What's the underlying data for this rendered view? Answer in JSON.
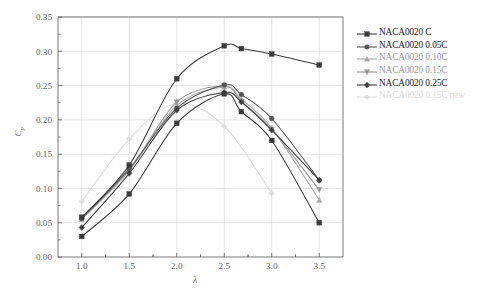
{
  "chart_data": {
    "type": "line",
    "title": "",
    "subtitle": "",
    "xlabel": "λ",
    "ylabel": "C_p",
    "xlim": [
      0.75,
      3.75
    ],
    "ylim": [
      0.0,
      0.35
    ],
    "xticks": [
      "1.0",
      "1.5",
      "2.0",
      "2.5",
      "3.0",
      "3.5"
    ],
    "xtick_values": [
      1.0,
      1.5,
      2.0,
      2.5,
      3.0,
      3.5
    ],
    "yticks": [
      "0.00",
      "0.05",
      "0.10",
      "0.15",
      "0.20",
      "0.25",
      "0.30",
      "0.35"
    ],
    "ytick_values": [
      0.0,
      0.05,
      0.1,
      0.15,
      0.2,
      0.25,
      0.3,
      0.35
    ],
    "grid": true,
    "grid_color": "#d8d8d8",
    "legend_position": "right",
    "series": [
      {
        "name": "NACA0020 C",
        "marker": "square",
        "color": "#3b3b3b",
        "x": [
          1.0,
          1.5,
          2.0,
          2.5,
          2.68,
          3.0,
          3.5
        ],
        "values": [
          0.058,
          0.134,
          0.26,
          0.308,
          0.304,
          0.296,
          0.28
        ]
      },
      {
        "name": "NACA0020 0.05C",
        "marker": "circle",
        "color": "#555555",
        "x": [
          1.0,
          1.5,
          2.0,
          2.5,
          2.68,
          3.0,
          3.5
        ],
        "values": [
          0.056,
          0.129,
          0.217,
          0.251,
          0.237,
          0.202,
          0.112
        ]
      },
      {
        "name": "NACA0020 0.10C",
        "marker": "triangle-up",
        "color": "#a8a8a8",
        "x": [
          1.0,
          1.5,
          2.0,
          2.5,
          2.68,
          3.0,
          3.5
        ],
        "values": [
          0.055,
          0.126,
          0.221,
          0.248,
          0.23,
          0.188,
          0.083
        ]
      },
      {
        "name": "NACA0020 0.15C",
        "marker": "triangle-down",
        "color": "#949494",
        "x": [
          1.0,
          1.5,
          2.0,
          2.5,
          2.68,
          3.0,
          3.5
        ],
        "values": [
          0.057,
          0.127,
          0.226,
          0.249,
          0.227,
          0.186,
          0.098
        ]
      },
      {
        "name": "NACA0020 0.25C",
        "marker": "diamond",
        "color": "#3f3f3f",
        "x": [
          1.0,
          1.5,
          2.0,
          2.5,
          2.68,
          3.0,
          3.5
        ],
        "values": [
          0.043,
          0.122,
          0.214,
          0.24,
          0.226,
          0.185,
          0.112
        ]
      },
      {
        "name": "NACA0020 0.15C new",
        "marker": "diamond-left",
        "color": "#dcdcdc",
        "x": [
          1.0,
          1.5,
          2.0,
          2.5,
          3.0
        ],
        "values": [
          0.081,
          0.172,
          0.224,
          0.191,
          0.093
        ]
      },
      {
        "name": "lowest-dark-curve",
        "marker": "square",
        "color": "#3b3b3b",
        "x": [
          1.0,
          1.5,
          2.0,
          2.5,
          2.68,
          3.0,
          3.5
        ],
        "values": [
          0.03,
          0.092,
          0.195,
          0.238,
          0.212,
          0.17,
          0.05
        ]
      }
    ]
  },
  "legend": {
    "items": [
      {
        "label": "NACA0020 C",
        "marker": "square",
        "color": "#3b3b3b"
      },
      {
        "label": "NACA0020 0.05C",
        "marker": "circle",
        "color": "#555555"
      },
      {
        "label": "NACA0020 0.10C",
        "marker": "triangle-up",
        "color": "#a8a8a8"
      },
      {
        "label": "NACA0020 0.15C",
        "marker": "triangle-down",
        "color": "#949494"
      },
      {
        "label": "NACA0020 0.25C",
        "marker": "diamond",
        "color": "#3f3f3f"
      },
      {
        "label": "NACA0020 0.15C new",
        "marker": "diamond-left",
        "color": "#dcdcdc"
      }
    ]
  },
  "axes": {
    "x_label": "λ",
    "y_label": "Cp"
  }
}
